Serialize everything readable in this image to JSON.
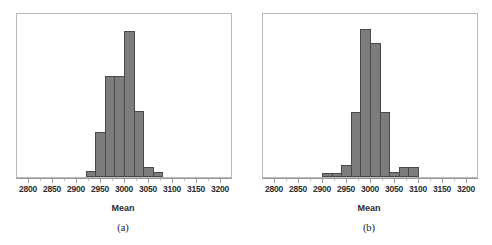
{
  "figure": {
    "background": "#ffffff",
    "bar_fill": "#7c7c7c",
    "bar_edge": "#4a4a4a",
    "frame_color": "#b9b9b9"
  },
  "axis": {
    "xlabel": "Mean",
    "tick_labels": [
      "2800",
      "2850",
      "2900",
      "2950",
      "3000",
      "3050",
      "3100",
      "3150",
      "3200"
    ],
    "tick_values": [
      2800,
      2850,
      2900,
      2950,
      3000,
      3050,
      3100,
      3150,
      3200
    ],
    "xlim": [
      2775,
      3225
    ]
  },
  "panels": [
    {
      "caption": "(a)",
      "chart_data": {
        "type": "bar",
        "title": "",
        "xlabel": "Mean",
        "ylabel": "",
        "xlim": [
          2775,
          3225
        ],
        "ylim": [
          0,
          165
        ],
        "grid": false,
        "legend": "none",
        "bin_width": 20,
        "bin_edges": [
          2920,
          2940,
          2960,
          2980,
          3000,
          3020,
          3040,
          3060,
          3080
        ],
        "categories": [
          "2920-2940",
          "2940-2960",
          "2960-2980",
          "2980-3000",
          "3000-3020",
          "3020-3040",
          "3040-3060",
          "3060-3080"
        ],
        "values": [
          6,
          45,
          101,
          101,
          146,
          66,
          10,
          5
        ]
      }
    },
    {
      "caption": "(b)",
      "chart_data": {
        "type": "bar",
        "title": "",
        "xlabel": "Mean",
        "ylabel": "",
        "xlim": [
          2775,
          3225
        ],
        "ylim": [
          0,
          165
        ],
        "grid": false,
        "legend": "none",
        "bin_width": 20,
        "bin_edges": [
          2900,
          2920,
          2940,
          2960,
          2980,
          3000,
          3020,
          3040,
          3060,
          3080,
          3100
        ],
        "categories": [
          "2900-2920",
          "2920-2940",
          "2940-2960",
          "2960-2980",
          "2980-3000",
          "3000-3020",
          "3020-3040",
          "3040-3060",
          "3060-3080",
          "3080-3100"
        ],
        "values": [
          4,
          4,
          12,
          65,
          148,
          134,
          65,
          5,
          10,
          10
        ]
      }
    }
  ]
}
